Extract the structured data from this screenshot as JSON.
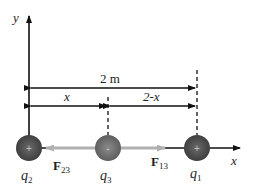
{
  "diagram": {
    "axes": {
      "x_label": "x",
      "y_label": "y"
    },
    "dimensions": {
      "total": "2 m",
      "left_segment": "x",
      "right_segment": "2-x"
    },
    "charges": [
      {
        "id": "q2",
        "label_main": "q",
        "label_sub": "2",
        "sign": "+",
        "color": "#4a4a4a"
      },
      {
        "id": "q3",
        "label_main": "q",
        "label_sub": "3",
        "sign": "-",
        "color": "#6b6b6b"
      },
      {
        "id": "q1",
        "label_main": "q",
        "label_sub": "1",
        "sign": "+",
        "color": "#4a4a4a"
      }
    ],
    "forces": [
      {
        "id": "F23",
        "label_main": "F",
        "label_sub": "23",
        "direction": "left",
        "color": "#aaaaaa"
      },
      {
        "id": "F13",
        "label_main": "F",
        "label_sub": "13",
        "direction": "right",
        "color": "#aaaaaa"
      }
    ]
  }
}
